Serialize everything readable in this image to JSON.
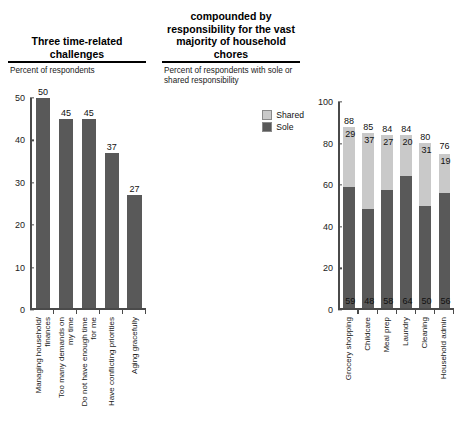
{
  "left_panel": {
    "title": "Three time-related challenges",
    "subtitle": "Percent of respondents",
    "legend": []
  },
  "right_panel": {
    "title": "compounded by responsibility for the vast majority of household chores",
    "subtitle": "Percent of respondents with sole or shared responsibility",
    "legend": [
      {
        "label": "Shared",
        "color": "#c9c9c9"
      },
      {
        "label": "Sole",
        "color": "#595959"
      }
    ]
  },
  "chart_data": [
    {
      "type": "bar",
      "title": "Three time-related challenges",
      "subtitle": "Percent of respondents",
      "xlabel": "",
      "ylabel": "",
      "ylim": [
        0,
        50
      ],
      "yticks": [
        0,
        10,
        20,
        30,
        40,
        50
      ],
      "grid": false,
      "bar_color": "#595959",
      "categories": [
        "Managing household/\nfinances",
        "Too many demands on\nmy time",
        "Do not have enough time\nfor me",
        "Have conflicting priorities",
        "Aging gracefully"
      ],
      "values": [
        50,
        45,
        45,
        37,
        27
      ],
      "data_labels": [
        "50",
        "45",
        "45",
        "37",
        "27"
      ]
    },
    {
      "type": "bar",
      "subtype": "stacked",
      "title": "compounded by responsibility for the vast majority of household chores",
      "subtitle": "Percent of respondents with sole or shared responsibility",
      "xlabel": "",
      "ylabel": "",
      "ylim": [
        0,
        100
      ],
      "yticks": [
        0,
        20,
        40,
        60,
        80,
        100
      ],
      "grid": false,
      "legend_position": "top-right",
      "categories": [
        "Grocery shopping",
        "Childcare",
        "Meal prep",
        "Laundry",
        "Cleaning",
        "Household admin"
      ],
      "series": [
        {
          "name": "Sole",
          "color": "#595959",
          "values": [
            59,
            48,
            58,
            64,
            50,
            56
          ]
        },
        {
          "name": "Shared",
          "color": "#c9c9c9",
          "values": [
            29,
            37,
            27,
            20,
            31,
            19
          ]
        }
      ],
      "totals": [
        88,
        85,
        84,
        84,
        80,
        76
      ]
    }
  ]
}
